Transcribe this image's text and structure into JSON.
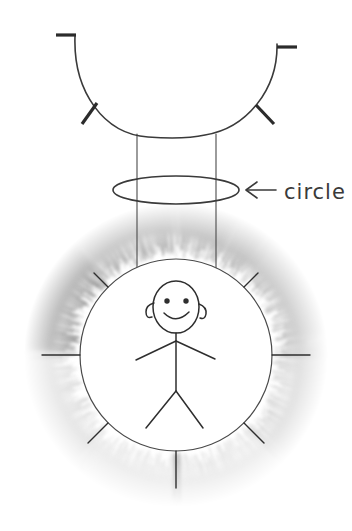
{
  "canvas": {
    "width": 352,
    "height": 531,
    "background": "#ffffff"
  },
  "annotation": {
    "label": "circle",
    "arrow_icon": "left-arrow-icon",
    "arrow_glyph": "←",
    "label_x": 282,
    "label_y": 199,
    "points_to": "tutu-ellipse"
  },
  "figure": {
    "name": "stick-figure-ballerina",
    "head": {
      "cx": 176,
      "cy": 307,
      "rx": 23,
      "ry": 26
    },
    "eyes": [
      {
        "cx": 167,
        "cy": 301,
        "r": 2.6
      },
      {
        "cx": 186,
        "cy": 301,
        "r": 2.6
      }
    ],
    "smile": "curved-mouth",
    "hair": "two-side-curls",
    "body": {
      "neck_y": 333,
      "hip_y": 388,
      "arm_span": 58,
      "leg_span": 46
    }
  },
  "shapes": {
    "u_curve": {
      "name": "arms-u-curve",
      "cx": 176,
      "cy": 52,
      "rx": 100,
      "ry": 88,
      "end_caps": "horizontal"
    },
    "cylinder": {
      "name": "torso-cylinder",
      "left_x": 137,
      "right_x": 216,
      "top_y": 132,
      "bottom_y": 272
    },
    "ellipse": {
      "name": "tutu-ellipse",
      "cx": 176,
      "cy": 190,
      "rx": 63,
      "ry": 14
    },
    "inner_disc": {
      "name": "body-disc",
      "cx": 176,
      "cy": 355,
      "r": 96
    },
    "skirt": {
      "name": "tutu-fringe-ring",
      "cx": 176,
      "cy": 355,
      "inner_r": 96,
      "outer_r": 152
    }
  },
  "colors": {
    "ink": "#3a3a3a",
    "ink_dark": "#2b2b2b",
    "paper": "#ffffff",
    "skirt_darkest": "#6e6e6e",
    "skirt_dark": "#8a8a8a",
    "skirt_mid": "#a8a8a8",
    "skirt_light": "#c9c9c9",
    "skirt_lightest": "#e4e4e4"
  },
  "skirt_segments": [
    {
      "name": "segment-upper-left",
      "start_deg": 182,
      "end_deg": 228,
      "tone": "#6e6e6e"
    },
    {
      "name": "segment-top-left",
      "start_deg": 228,
      "end_deg": 268,
      "tone": "#8f8f8f"
    },
    {
      "name": "segment-top-right",
      "start_deg": 272,
      "end_deg": 312,
      "tone": "#949494"
    },
    {
      "name": "segment-upper-right",
      "start_deg": 312,
      "end_deg": 358,
      "tone": "#a5a5a5"
    },
    {
      "name": "segment-lower-right",
      "start_deg": 2,
      "end_deg": 46,
      "tone": "#c2c2c2"
    },
    {
      "name": "segment-bottom-right",
      "start_deg": 46,
      "end_deg": 88,
      "tone": "#d8d8d8"
    },
    {
      "name": "segment-bottom-left",
      "start_deg": 92,
      "end_deg": 134,
      "tone": "#dcdcdc"
    },
    {
      "name": "segment-lower-left",
      "start_deg": 134,
      "end_deg": 178,
      "tone": "#cfcfcf"
    }
  ],
  "spokes": [
    {
      "name": "spoke-nw",
      "angle_deg": 225
    },
    {
      "name": "spoke-ne",
      "angle_deg": 315
    },
    {
      "name": "spoke-w",
      "angle_deg": 180
    },
    {
      "name": "spoke-e",
      "angle_deg": 0
    },
    {
      "name": "spoke-sw",
      "angle_deg": 135
    },
    {
      "name": "spoke-se",
      "angle_deg": 45
    },
    {
      "name": "spoke-s",
      "angle_deg": 90
    }
  ]
}
